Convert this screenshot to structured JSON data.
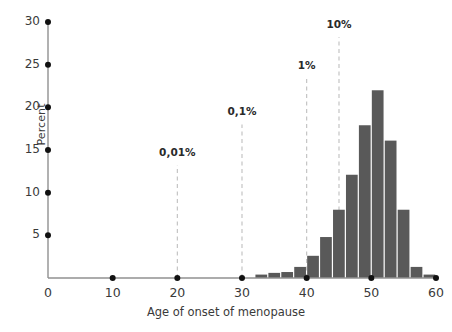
{
  "chart_data": {
    "type": "bar",
    "title": "",
    "subtitle": "",
    "xlabel": "Age of onset of menopause",
    "ylabel": "Percent",
    "xlim": [
      0,
      60
    ],
    "ylim": [
      0,
      30
    ],
    "grid": false,
    "legend": null,
    "bar_width_years": 2,
    "x_ticks": [
      0,
      10,
      20,
      30,
      40,
      50,
      60
    ],
    "x_tick_labels": [
      "0",
      "10",
      "20",
      "30",
      "40",
      "50",
      "60"
    ],
    "y_ticks": [
      5,
      10,
      15,
      20,
      25,
      30
    ],
    "y_tick_labels": [
      "5",
      "10",
      "15",
      "20",
      "25",
      "30"
    ],
    "bar_color": "#595959",
    "axis_color": "#808080",
    "annotation_line_color": "#bfbfbf",
    "categories": [
      33,
      35,
      37,
      39,
      41,
      43,
      45,
      47,
      49,
      51,
      53,
      55,
      57,
      59
    ],
    "values": [
      0.4,
      0.6,
      0.7,
      1.3,
      2.6,
      4.8,
      8.0,
      12.1,
      17.9,
      22.0,
      16.1,
      8.0,
      1.3,
      0.4
    ],
    "annotations": [
      {
        "label": "0,01%",
        "x": 20,
        "y_top": 13.2,
        "label_y": 14.6
      },
      {
        "label": "0,1%",
        "x": 30,
        "y_top": 18.0,
        "label_y": 19.4
      },
      {
        "label": "1%",
        "x": 40,
        "y_top": 23.5,
        "label_y": 24.9
      },
      {
        "label": "10%",
        "x": 45,
        "y_top": 28.2,
        "label_y": 29.6
      }
    ]
  },
  "axis": {
    "y_title": "Percent",
    "x_title": "Age of onset of menopause"
  }
}
